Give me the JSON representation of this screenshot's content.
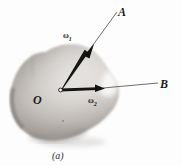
{
  "figure": {
    "caption": "(a)",
    "background_color": "#fdfdfd",
    "ink_color": "#1b1b1b",
    "body_fill_light": "#f2f0ee",
    "body_fill_mid": "#cfcac6",
    "body_fill_dark": "#8d8884",
    "labels": {
      "point_origin": "O",
      "axis_a": "A",
      "axis_b": "B",
      "omega_1": "ω",
      "omega_1_sub": "1",
      "omega_2": "ω",
      "omega_2_sub": "2"
    },
    "vectors": [
      {
        "name": "omega_1",
        "label": "ω₁",
        "from": [
          61,
          90
        ],
        "to": [
          93,
          45
        ],
        "axis_label": "A",
        "axis_line_to": [
          117,
          11
        ]
      },
      {
        "name": "omega_2",
        "label": "ω₂",
        "from": [
          61,
          90
        ],
        "to": [
          104,
          88
        ],
        "axis_label": "B",
        "axis_line_to": [
          158,
          83
        ]
      }
    ]
  }
}
